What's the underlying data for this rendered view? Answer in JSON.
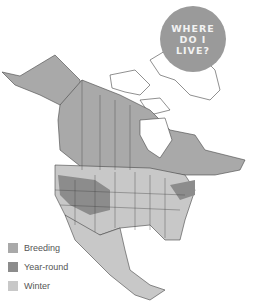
{
  "badge": {
    "lines": [
      "WHERE",
      "DO I",
      "LIVE?"
    ]
  },
  "legend": [
    {
      "label": "Breeding",
      "color": "#a9a9a9"
    },
    {
      "label": "Year-round",
      "color": "#8c8c8c"
    },
    {
      "label": "Winter",
      "color": "#c8c8c8"
    }
  ],
  "colors": {
    "land": "#ffffff",
    "border": "#444444"
  }
}
